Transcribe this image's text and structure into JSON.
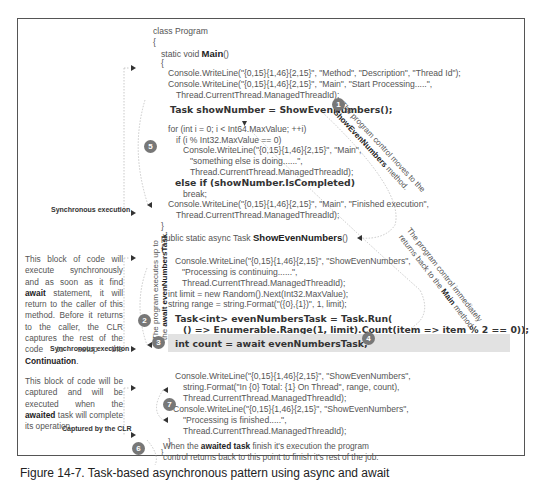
{
  "figure": {
    "caption": "Figure 14-7. Task-based asynchronous pattern using async and await"
  },
  "code": {
    "class_decl": "class Program",
    "open_brace_1": "{",
    "main_decl_prefix": "static void ",
    "main_decl_name": "Main",
    "main_decl_suffix": "()",
    "open_brace_2": "{",
    "line_wl1": "Console.WriteLine(\"{0,15}{1,46}{2,15}\", \"Method\", \"Description\", \"Thread Id\");",
    "line_wl2a": "Console.WriteLine(\"{0,15}{1,46}{2,15}\", \"Main\", \"Start Processing.....\",",
    "line_wl2b": "Thread.CurrentThread.ManagedThreadId);",
    "task_line": "Task showNumber = ShowEvenNumbers();",
    "for_line": "for (int i = 0; i < Int64.MaxValue; ++i)",
    "if_line": "if (i % Int32.MaxValue == 0)",
    "wl3a": "Console.WriteLine(\"{0,15}{1,46}{2,15}\", \"Main\",",
    "wl3b": "\"something else is doing......\",",
    "wl3c": "Thread.CurrentThread.ManagedThreadId);",
    "else_if_line": "else if (showNumber.IsCompleted)",
    "break_line": "break;",
    "wl4a": "Console.WriteLine(\"{0,15}{1,46}{2,15}\", \"Main\", \"Finished execution\",",
    "wl4b": "Thread.CurrentThread.ManagedThreadId);",
    "close_brace_main": "}",
    "async_decl_prefix": "public static async Task ",
    "async_decl_name": "ShowEvenNumbers",
    "async_decl_suffix": "()",
    "open_brace_3": "{",
    "wl5a": "Console.WriteLine(\"{0,15}{1,46}{2,15}\", \"ShowEvenNumbers\",",
    "wl5b": "\"Processing is continuing......\",",
    "wl5c": "Thread.CurrentThread.ManagedThreadId);",
    "limit_line": "int limit = new Random().Next(Int32.MaxValue);",
    "range_line": "string range = string.Format(\"({0},{1})\", 1, limit);",
    "task_run_a": "Task<int> evenNumbersTask = Task.Run(",
    "task_run_b": "() => Enumerable.Range(1, limit).Count(item => item % 2 == 0));",
    "await_line": "int count = await evenNumbersTask;",
    "wl6a": "Console.WriteLine(\"{0,15}{1,46}{2,15}\", \"ShowEvenNumbers\",",
    "wl6b": "string.Format(\"In {0} Total: {1} On Thread\", range, count),",
    "wl6c": "Thread.CurrentThread.ManagedThreadId);",
    "wl7a": "Console.WriteLine(\"{0,15}{1,46}{2,15}\", \"ShowEvenNumbers\",",
    "wl7b": "\"Processing is finished.....\",",
    "wl7c": "Thread.CurrentThread.ManagedThreadId);",
    "close_brace_4": "}",
    "close_brace_5": "}"
  },
  "annotations": {
    "sync_exec_1": "Synchronous execution",
    "sync_exec_2": "Synchronous execution",
    "captured_by_clr": "Captured by the CLR",
    "block1_text_a": "This block of code will execute synchronously and as soon as it find ",
    "block1_await": "await",
    "block1_text_b": " statement, it will return to the caller of this method. Before it returns to the caller, the CLR captures the rest of the code to setup the ",
    "block1_continuation": "Continuation",
    "block1_end": ".",
    "block2_text_a": "This block of code will be captured and will be executed when the ",
    "block2_awaited": "awaited",
    "block2_text_b": " task will complete its operation.",
    "note1_a": "The program control moves to the",
    "note1_b_bold": "ShowEvenNumbers",
    "note1_b_rest": " method.",
    "note2_a": "The program executes up to",
    "note2_b_prefix": "the ",
    "note2_b_bold": "await evenNumbersTask.",
    "note4_a": "The program control immediately",
    "note4_b_prefix": "returns back to the ",
    "note4_b_bold": "Main",
    "note4_b_suffix": " method.",
    "note8_prefix": "When the ",
    "note8_bold": "awaited task",
    "note8_rest_1": " finish it's execution the program",
    "note8_line2": "control returns back to this point to finish it's rest of the job."
  },
  "badges": [
    "1",
    "2",
    "3",
    "4",
    "5",
    "6",
    "7"
  ],
  "colors": {
    "badge": "#777777",
    "highlight": "#e2e2e2",
    "border": "#555555",
    "text": "#555555"
  }
}
